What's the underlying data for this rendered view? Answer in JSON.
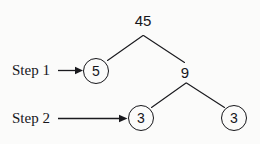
{
  "diagram": {
    "background_color": "#fbfbfa",
    "ink_color": "#16161a",
    "nodes": {
      "root": {
        "value": "45",
        "circled": false
      },
      "left_child": {
        "value": "5",
        "circled": true
      },
      "right_child": {
        "value": "9",
        "circled": false
      },
      "leaf_left": {
        "value": "3",
        "circled": true
      },
      "leaf_right": {
        "value": "3",
        "circled": true
      }
    },
    "annotations": [
      {
        "label": "Step 1",
        "points_to": "5"
      },
      {
        "label": "Step 2",
        "points_to": "3"
      }
    ]
  }
}
